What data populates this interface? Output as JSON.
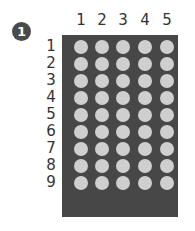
{
  "badge": {
    "label": "1"
  },
  "grid": {
    "columns": [
      "1",
      "2",
      "3",
      "4",
      "5"
    ],
    "rows": [
      "1",
      "2",
      "3",
      "4",
      "5",
      "6",
      "7",
      "8",
      "9"
    ],
    "colors": {
      "panel": "#474747",
      "dot": "#cfcfcf",
      "text": "#333333"
    }
  }
}
